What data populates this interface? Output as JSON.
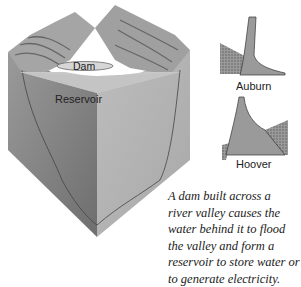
{
  "diagram": {
    "labels": {
      "dam": "Dam",
      "reservoir": "Reservoir"
    },
    "profiles": [
      {
        "name": "Auburn"
      },
      {
        "name": "Hoover"
      }
    ],
    "caption_lines": [
      "A dam built across a",
      "river valley causes the",
      "water behind it to flood",
      "the valley and form a",
      "reservoir to store water or",
      "to generate electricity."
    ]
  }
}
